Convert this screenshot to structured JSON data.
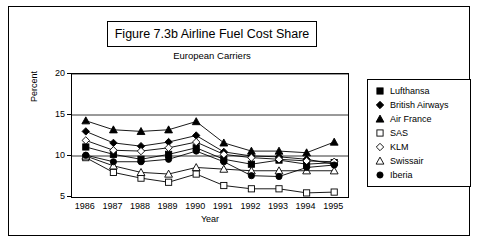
{
  "chart_data": {
    "type": "line",
    "title": "Figure 7.3b  Airline Fuel Cost Share",
    "subtitle": "European Carriers",
    "xlabel": "Year",
    "ylabel": "Percent",
    "categories": [
      "1986",
      "1987",
      "1988",
      "1989",
      "1990",
      "1991",
      "1992",
      "1993",
      "1994",
      "1995"
    ],
    "ylim": [
      5,
      20
    ],
    "yticks": [
      5,
      10,
      15,
      20
    ],
    "grid": true,
    "legend_position": "right",
    "series": [
      {
        "name": "Lufthansa",
        "marker": "filled-square",
        "values": [
          11.1,
          10.2,
          9.6,
          10.2,
          11.0,
          9.6,
          9.0,
          9.5,
          9.0,
          9.2
        ]
      },
      {
        "name": "British Airways",
        "marker": "filled-diamond",
        "values": [
          13.0,
          11.6,
          11.2,
          11.7,
          12.5,
          10.5,
          10.0,
          9.9,
          9.6,
          9.0
        ]
      },
      {
        "name": "Air France",
        "marker": "filled-triangle",
        "values": [
          14.3,
          13.2,
          13.0,
          13.2,
          14.2,
          11.6,
          10.6,
          10.6,
          10.4,
          11.7
        ]
      },
      {
        "name": "SAS",
        "marker": "open-square",
        "values": [
          9.8,
          8.0,
          7.3,
          6.8,
          7.8,
          6.4,
          6.0,
          6.0,
          5.5,
          5.6
        ]
      },
      {
        "name": "KLM",
        "marker": "open-diamond",
        "values": [
          11.9,
          10.7,
          10.6,
          11.0,
          11.7,
          10.2,
          9.8,
          9.6,
          9.4,
          9.3
        ]
      },
      {
        "name": "Swissair",
        "marker": "open-triangle",
        "values": [
          10.0,
          8.8,
          8.0,
          7.8,
          8.6,
          8.4,
          8.2,
          8.2,
          8.2,
          8.2
        ]
      },
      {
        "name": "Iberia",
        "marker": "filled-circle",
        "values": [
          10.1,
          9.3,
          9.3,
          9.6,
          10.6,
          9.3,
          7.6,
          7.5,
          8.6,
          8.9
        ]
      }
    ]
  }
}
